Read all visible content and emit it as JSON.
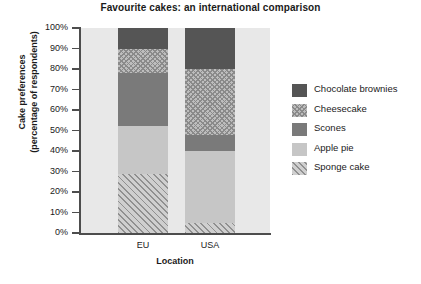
{
  "chart_data": {
    "type": "bar",
    "subtype": "stacked-bar-100-percent",
    "title": "Favourite cakes: an international comparison",
    "xlabel": "Location",
    "ylabel": "Cake preferences (percentage of respondents)",
    "ylabel_line1": "Cake preferences",
    "ylabel_line2": "(percentage of respondents)",
    "categories": [
      "EU",
      "USA"
    ],
    "ylim": [
      0,
      100
    ],
    "ytick_values": [
      0,
      10,
      20,
      30,
      40,
      50,
      60,
      70,
      80,
      90,
      100
    ],
    "ytick_labels": [
      "0%",
      "10%",
      "20%",
      "30%",
      "40%",
      "50%",
      "60%",
      "70%",
      "80%",
      "90%",
      "100%"
    ],
    "grid": false,
    "legend_position": "right",
    "units": "percent",
    "series": [
      {
        "name": "Chocolate brownies",
        "pattern": "solid",
        "color": "#555555",
        "values": [
          10,
          20
        ],
        "ranges": [
          [
            90,
            100
          ],
          [
            80,
            100
          ]
        ]
      },
      {
        "name": "Cheesecake",
        "pattern": "crosshatch",
        "color": "#bdbdbd",
        "values": [
          12,
          32
        ],
        "ranges": [
          [
            78,
            90
          ],
          [
            48,
            80
          ]
        ]
      },
      {
        "name": "Scones",
        "pattern": "solid",
        "color": "#7a7a7a",
        "values": [
          26,
          8
        ],
        "ranges": [
          [
            52,
            78
          ],
          [
            40,
            48
          ]
        ]
      },
      {
        "name": "Apple pie",
        "pattern": "solid",
        "color": "#c6c6c6",
        "values": [
          23,
          35
        ],
        "ranges": [
          [
            29,
            52
          ],
          [
            5,
            40
          ]
        ]
      },
      {
        "name": "Sponge cake",
        "pattern": "diagonal",
        "color": "#cfcfcf",
        "values": [
          29,
          5
        ],
        "ranges": [
          [
            0,
            29
          ],
          [
            0,
            5
          ]
        ]
      }
    ]
  },
  "legend": {
    "items": [
      {
        "label": "Chocolate brownies"
      },
      {
        "label": "Cheesecake"
      },
      {
        "label": "Scones"
      },
      {
        "label": "Apple pie"
      },
      {
        "label": "Sponge cake"
      }
    ]
  },
  "colors": {
    "plot_background": "#e8e8e8",
    "axis": "#4d4d4d",
    "text": "#1a1a1a"
  }
}
